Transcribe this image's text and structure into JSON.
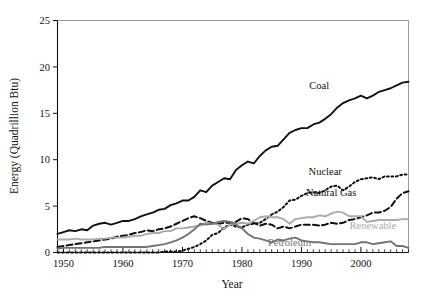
{
  "chart_data": {
    "type": "line",
    "title": "",
    "xlabel": "Year",
    "ylabel": "Energy (Quadrillion Btu)",
    "xlim": [
      1949,
      2008
    ],
    "ylim": [
      0,
      25
    ],
    "xticks": [
      1950,
      1960,
      1970,
      1980,
      1990,
      2000
    ],
    "xticklabels": [
      "1950",
      "1960",
      "1970",
      "1980",
      "1990",
      "2000"
    ],
    "yticks": [
      0,
      5,
      10,
      15,
      20,
      25
    ],
    "yticklabels": [
      "0",
      "5",
      "10",
      "15",
      "20",
      "25"
    ],
    "minor_xtick_interval": 1,
    "grid": false,
    "legend": "inline-annotations",
    "x": [
      1949,
      1950,
      1951,
      1952,
      1953,
      1954,
      1955,
      1956,
      1957,
      1958,
      1959,
      1960,
      1961,
      1962,
      1963,
      1964,
      1965,
      1966,
      1967,
      1968,
      1969,
      1970,
      1971,
      1972,
      1973,
      1974,
      1975,
      1976,
      1977,
      1978,
      1979,
      1980,
      1981,
      1982,
      1983,
      1984,
      1985,
      1986,
      1987,
      1988,
      1989,
      1990,
      1991,
      1992,
      1993,
      1994,
      1995,
      1996,
      1997,
      1998,
      1999,
      2000,
      2001,
      2002,
      2003,
      2004,
      2005,
      2006,
      2007,
      2008
    ],
    "series": [
      {
        "name": "Coal",
        "style": "solid",
        "color": "#111111",
        "label_x": 1993,
        "label_y": 17.6,
        "values": [
          2.0,
          2.2,
          2.4,
          2.3,
          2.5,
          2.4,
          2.9,
          3.1,
          3.2,
          3.0,
          3.2,
          3.4,
          3.4,
          3.6,
          3.9,
          4.1,
          4.3,
          4.6,
          4.7,
          5.1,
          5.3,
          5.6,
          5.6,
          6.0,
          6.7,
          6.5,
          7.2,
          7.6,
          8.0,
          7.9,
          8.9,
          9.4,
          9.8,
          9.6,
          10.4,
          11.0,
          11.4,
          11.5,
          12.2,
          12.9,
          13.2,
          13.4,
          13.4,
          13.8,
          14.0,
          14.4,
          14.9,
          15.6,
          16.1,
          16.4,
          16.6,
          16.9,
          16.6,
          16.9,
          17.3,
          17.5,
          17.7,
          18.0,
          18.3,
          18.4
        ]
      },
      {
        "name": "Natural Gas",
        "style": "dashed",
        "color": "#111111",
        "label_x": 1995,
        "label_y": 6.1,
        "values": [
          0.6,
          0.7,
          0.8,
          0.9,
          1.0,
          1.1,
          1.2,
          1.3,
          1.4,
          1.5,
          1.7,
          1.8,
          1.9,
          2.1,
          2.2,
          2.4,
          2.3,
          2.5,
          2.6,
          2.8,
          3.1,
          3.4,
          3.7,
          3.9,
          3.7,
          3.4,
          3.2,
          3.1,
          3.2,
          3.2,
          3.3,
          3.7,
          3.6,
          3.2,
          2.9,
          3.1,
          3.0,
          2.6,
          2.8,
          2.6,
          2.8,
          3.0,
          3.0,
          3.0,
          2.9,
          3.0,
          3.2,
          3.1,
          3.2,
          3.5,
          3.6,
          3.8,
          4.0,
          4.3,
          4.3,
          4.5,
          4.9,
          5.8,
          6.4,
          6.6
        ]
      },
      {
        "name": "Nuclear",
        "style": "dotted",
        "color": "#111111",
        "label_x": 1994,
        "label_y": 8.3,
        "values": [
          0,
          0,
          0,
          0,
          0,
          0,
          0,
          0,
          0,
          0,
          0,
          0,
          0,
          0,
          0,
          0,
          0,
          0,
          0.1,
          0.1,
          0.1,
          0.2,
          0.4,
          0.6,
          0.9,
          1.3,
          1.9,
          2.1,
          2.7,
          3.0,
          2.8,
          2.7,
          3.0,
          3.1,
          3.2,
          3.6,
          4.1,
          4.4,
          4.9,
          5.6,
          5.7,
          6.1,
          6.4,
          6.5,
          6.4,
          6.7,
          7.1,
          7.2,
          6.7,
          7.1,
          7.6,
          7.9,
          8.0,
          8.1,
          7.9,
          8.2,
          8.2,
          8.2,
          8.4,
          8.4
        ]
      },
      {
        "name": "Renewable",
        "style": "solid",
        "color": "#ababab",
        "label_x": 2002,
        "label_y": 2.55,
        "values": [
          1.4,
          1.4,
          1.4,
          1.5,
          1.4,
          1.4,
          1.4,
          1.5,
          1.5,
          1.6,
          1.6,
          1.6,
          1.7,
          1.8,
          1.8,
          2.0,
          2.1,
          2.1,
          2.3,
          2.3,
          2.6,
          2.6,
          2.7,
          2.8,
          2.9,
          3.2,
          3.1,
          3.0,
          2.5,
          3.0,
          3.1,
          3.2,
          3.1,
          3.4,
          3.8,
          3.9,
          3.8,
          3.8,
          3.6,
          3.1,
          3.6,
          3.7,
          3.8,
          3.8,
          4.0,
          3.9,
          4.2,
          4.4,
          4.3,
          3.9,
          3.9,
          3.9,
          3.3,
          3.4,
          3.5,
          3.5,
          3.5,
          3.5,
          3.6,
          3.6
        ]
      },
      {
        "name": "Petroleum",
        "style": "solid",
        "color": "#737373",
        "label_x": 1988,
        "label_y": 0.75,
        "values": [
          0.4,
          0.5,
          0.5,
          0.5,
          0.5,
          0.5,
          0.5,
          0.5,
          0.6,
          0.6,
          0.6,
          0.6,
          0.6,
          0.6,
          0.6,
          0.6,
          0.7,
          0.8,
          0.9,
          1.1,
          1.3,
          1.6,
          2.0,
          2.5,
          3.1,
          3.0,
          3.1,
          3.3,
          3.4,
          3.3,
          3.0,
          2.6,
          2.0,
          1.6,
          1.5,
          1.3,
          1.1,
          1.4,
          1.3,
          1.5,
          1.6,
          1.3,
          1.2,
          1.1,
          1.1,
          1.0,
          0.9,
          0.9,
          0.9,
          0.9,
          0.9,
          1.1,
          1.1,
          0.9,
          1.0,
          1.1,
          1.2,
          0.7,
          0.7,
          0.5
        ]
      }
    ]
  }
}
